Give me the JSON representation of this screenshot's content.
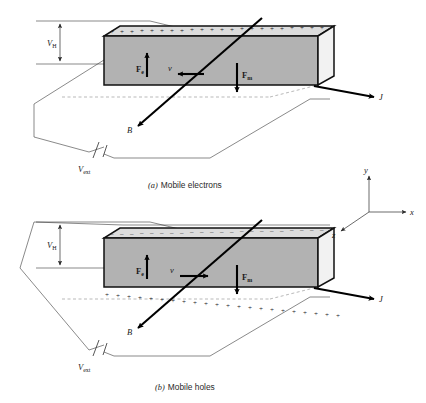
{
  "figure": {
    "panels": [
      {
        "id": "a",
        "caption_tag": "(a)",
        "caption_text": "Mobile electrons",
        "hall_voltage_label": "V",
        "hall_voltage_sub": "H",
        "external_voltage_label": "V",
        "external_voltage_sub": "ext",
        "electric_force_label": "F",
        "electric_force_sub": "e",
        "magnetic_force_label": "F",
        "magnetic_force_sub": "m",
        "velocity_label": "v",
        "magnetic_field_label": "B",
        "current_label": "J",
        "top_surface_charge": "+",
        "bottom_surface_charge": "",
        "top_charge_count": 22,
        "bottom_charge_count": 0,
        "velocity_direction": "left",
        "electric_force_direction": "up",
        "magnetic_force_direction": "down"
      },
      {
        "id": "b",
        "caption_tag": "(b)",
        "caption_text": "Mobile holes",
        "hall_voltage_label": "V",
        "hall_voltage_sub": "H",
        "external_voltage_label": "V",
        "external_voltage_sub": "ext",
        "electric_force_label": "F",
        "electric_force_sub": "e",
        "magnetic_force_label": "F",
        "magnetic_force_sub": "m",
        "velocity_label": "v",
        "magnetic_field_label": "B",
        "current_label": "J",
        "top_surface_charge": "–",
        "bottom_surface_charge": "+",
        "top_charge_count": 22,
        "bottom_charge_count": 22,
        "velocity_direction": "right",
        "electric_force_direction": "up",
        "magnetic_force_direction": "down"
      }
    ],
    "axes": {
      "x_label": "x",
      "y_label": "y",
      "z_label": "z"
    },
    "colors": {
      "front_face": "#b2b2b2",
      "top_face": "#dcdcdc",
      "end_face": "#f2f2f2",
      "outline": "#111111",
      "thin_line": "#3a3a3a",
      "dashed_line": "#8a8a8a",
      "background": "#ffffff"
    }
  }
}
